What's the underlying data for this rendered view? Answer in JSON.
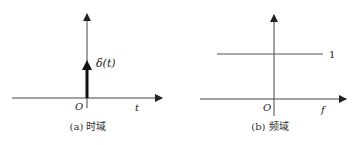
{
  "panels": [
    {
      "id": "a",
      "caption": "(a) 时域",
      "x_axis_label": "t",
      "origin_label": "O",
      "signal_label": "δ(t)",
      "signal_type": "impulse"
    },
    {
      "id": "b",
      "caption": "(b) 频域",
      "x_axis_label": "f",
      "origin_label": "O",
      "level_label": "1",
      "signal_type": "constant"
    }
  ],
  "colors": {
    "axis": "#333333",
    "signal": "#111111",
    "text": "#222222"
  }
}
